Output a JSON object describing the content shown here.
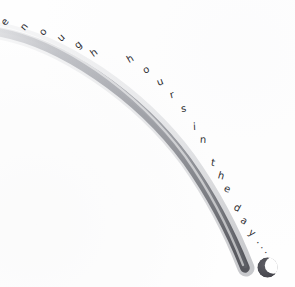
{
  "artwork": {
    "title": "enough hours in the day...",
    "medium_note": "pencil sketch",
    "background_color": "#fefefe",
    "graphite_color": "#6f7076",
    "ink_color": "#2f2f33",
    "moon_color": "#4a4a50"
  },
  "phrase": {
    "full_text": "enough hours in the day...",
    "letters": [
      {
        "char": "e",
        "x": 2,
        "y": 17,
        "rot": -53,
        "size": 10
      },
      {
        "char": "n",
        "x": 21,
        "y": 22,
        "rot": -50,
        "size": 10
      },
      {
        "char": "o",
        "x": 40,
        "y": 27,
        "rot": -47,
        "size": 10
      },
      {
        "char": "u",
        "x": 58,
        "y": 33,
        "rot": -44,
        "size": 10
      },
      {
        "char": "g",
        "x": 75,
        "y": 40,
        "rot": -40,
        "size": 10
      },
      {
        "char": "h",
        "x": 91,
        "y": 48,
        "rot": -36,
        "size": 10
      },
      {
        "char": "h",
        "x": 127,
        "y": 54,
        "rot": -30,
        "size": 10
      },
      {
        "char": "o",
        "x": 143,
        "y": 65,
        "rot": -26,
        "size": 10
      },
      {
        "char": "u",
        "x": 157,
        "y": 77,
        "rot": -21,
        "size": 10
      },
      {
        "char": "r",
        "x": 170,
        "y": 90,
        "rot": -15,
        "size": 10
      },
      {
        "char": "s",
        "x": 181,
        "y": 104,
        "rot": -9,
        "size": 10
      },
      {
        "char": "i",
        "x": 193,
        "y": 122,
        "rot": -3,
        "size": 10
      },
      {
        "char": "n",
        "x": 200,
        "y": 135,
        "rot": 3,
        "size": 10
      },
      {
        "char": "t",
        "x": 211,
        "y": 158,
        "rot": 11,
        "size": 10
      },
      {
        "char": "h",
        "x": 218,
        "y": 171,
        "rot": 16,
        "size": 10
      },
      {
        "char": "e",
        "x": 224,
        "y": 184,
        "rot": 21,
        "size": 10
      },
      {
        "char": "d",
        "x": 234,
        "y": 203,
        "rot": 28,
        "size": 10
      },
      {
        "char": "a",
        "x": 241,
        "y": 216,
        "rot": 33,
        "size": 10
      },
      {
        "char": "y",
        "x": 249,
        "y": 228,
        "rot": 38,
        "size": 10
      },
      {
        "char": ".",
        "x": 258,
        "y": 236,
        "rot": 44,
        "size": 10
      },
      {
        "char": ".",
        "x": 262,
        "y": 241,
        "rot": 46,
        "size": 10
      },
      {
        "char": ".",
        "x": 266,
        "y": 246,
        "rot": 48,
        "size": 10
      }
    ]
  },
  "moon": {
    "label": "crescent-moon",
    "x": 257,
    "y": 256,
    "width": 21,
    "height": 23
  },
  "arc": {
    "label": "graphite-arc",
    "description": "sweeping pencil arc from upper-left to lower-right"
  }
}
